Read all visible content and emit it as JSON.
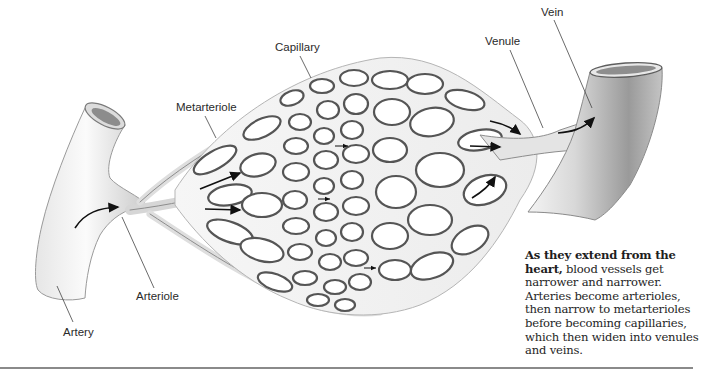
{
  "figure": {
    "labels": {
      "capillary": "Capillary",
      "metarteriole": "Metarteriole",
      "arteriole": "Arteriole",
      "artery": "Artery",
      "venule": "Venule",
      "vein": "Vein"
    },
    "caption": {
      "lead": "As they extend from the heart,",
      "body": " blood vessels get narrower and narrower. Arteries become arterioles, then narrow to metarterioles before becoming capillaries, which then widen into venules and veins."
    },
    "colors": {
      "vessel_outline": "#5a5a5a",
      "vessel_fill": "#f1f1f1",
      "vessel_shade": "#a8a8a8",
      "arrow": "#111111",
      "text": "#2a2a2a",
      "rule": "#8a8a8a"
    }
  }
}
